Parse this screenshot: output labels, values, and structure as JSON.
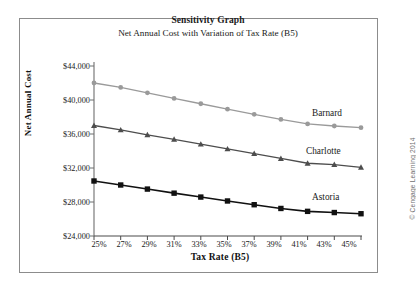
{
  "figure": {
    "title": "Sensitivity Graph",
    "subtitle": "Net Annual Cost with Variation of Tax Rate (B5)",
    "credit": "© Cengage Learning 2014",
    "frame_color": "#8c8c8c"
  },
  "chart_data": {
    "type": "line",
    "title": "Sensitivity Graph",
    "subtitle": "Net Annual Cost with Variation of Tax Rate (B5)",
    "xlabel": "Tax Rate (B5)",
    "ylabel": "Net Annual Cost",
    "categories": [
      "25%",
      "27%",
      "29%",
      "31%",
      "33%",
      "35%",
      "37%",
      "39%",
      "41%",
      "43%",
      "45%"
    ],
    "x": [
      25,
      27,
      29,
      31,
      33,
      35,
      37,
      39,
      41,
      43,
      45
    ],
    "xlim": [
      25,
      45
    ],
    "ylim": [
      24000,
      44000
    ],
    "ytick_labels": [
      "$44,000",
      "$40,000",
      "$36,000",
      "$32,000",
      "$28,000",
      "$24,000"
    ],
    "yticks": [
      44000,
      40000,
      36000,
      32000,
      28000,
      24000
    ],
    "grid": false,
    "legend": "inline-right-labels",
    "series": [
      {
        "name": "Barnard",
        "color": "#9a9a9a",
        "marker": "circle",
        "values": [
          42000,
          41480,
          40840,
          40180,
          39560,
          38920,
          38320,
          37720,
          37180,
          36940,
          36740
        ]
      },
      {
        "name": "Charlotte",
        "color": "#4d4d4d",
        "marker": "triangle",
        "values": [
          37000,
          36480,
          35900,
          35380,
          34800,
          34240,
          33700,
          33120,
          32560,
          32400,
          32080
        ]
      },
      {
        "name": "Astoria",
        "color": "#111111",
        "marker": "square",
        "values": [
          30470,
          30000,
          29520,
          29040,
          28580,
          28120,
          27680,
          27240,
          26900,
          26760,
          26620
        ]
      }
    ]
  },
  "axes": {
    "y_title": "Net Annual Cost",
    "x_title": "Tax Rate (B5)"
  },
  "series_labels": [
    {
      "name": "Barnard"
    },
    {
      "name": "Charlotte"
    },
    {
      "name": "Astoria"
    }
  ]
}
